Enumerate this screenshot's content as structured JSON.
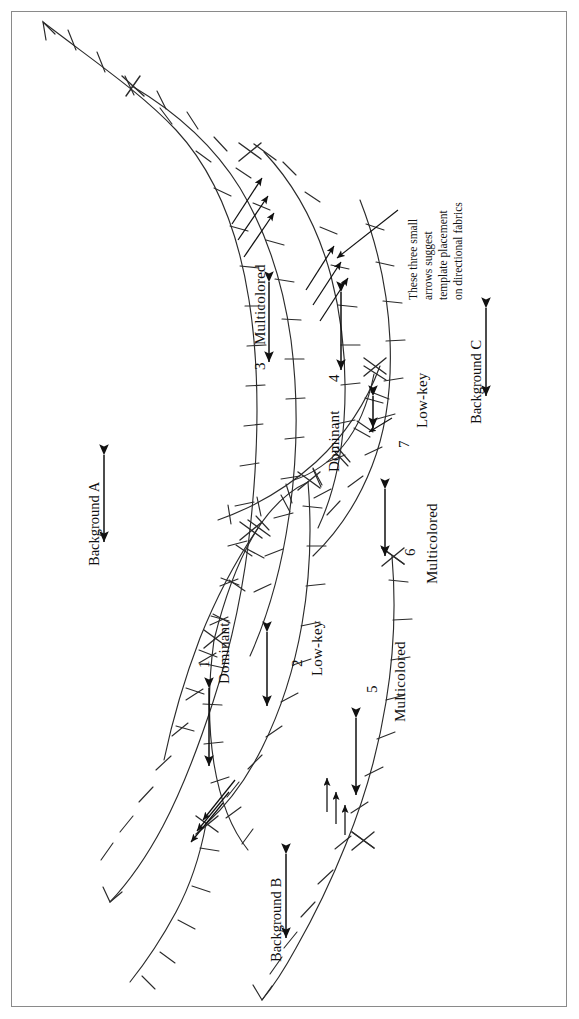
{
  "figure": {
    "type": "quilt-pattern-diagram",
    "orientation": "rotated-90-ccw",
    "border_color": "#8a8a8a",
    "line_color": "#2b2b2b"
  },
  "regions": [
    {
      "id": "region-1",
      "number": "1",
      "value": "Dominant"
    },
    {
      "id": "region-2",
      "number": "2",
      "value": "Low-key"
    },
    {
      "id": "region-3",
      "number": "3",
      "value": "Multicolored"
    },
    {
      "id": "region-4",
      "number": "4",
      "value": "Dominant"
    },
    {
      "id": "region-5",
      "number": "5",
      "value": "Multicolored"
    },
    {
      "id": "region-6",
      "number": "6",
      "value": "Multicolored"
    },
    {
      "id": "region-7",
      "number": "7",
      "value": "Low-key"
    }
  ],
  "backgrounds": [
    {
      "id": "background-a",
      "label": "Background A"
    },
    {
      "id": "background-b",
      "label": "Background B"
    },
    {
      "id": "background-c",
      "label": "Background C"
    }
  ],
  "annotation": {
    "lines": [
      "These three small",
      "arrows suggest",
      "template placement",
      "on directional fabrics"
    ],
    "line1": "These three small",
    "line2": "arrows suggest",
    "line3": "template placement",
    "line4": "on directional fabrics"
  }
}
